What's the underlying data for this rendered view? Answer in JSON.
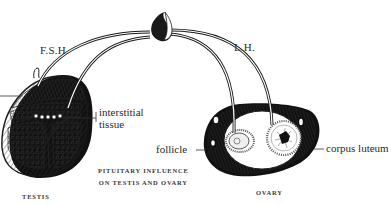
{
  "diagram": {
    "title_lines": [
      "PITUITARY INFLUENCE",
      "ON TESTIS AND OVARY"
    ],
    "hormones": {
      "fsh": "F.S.H.",
      "lh": "L.H."
    },
    "organs": {
      "testis": "TESTIS",
      "ovary": "OVARY"
    },
    "structures": {
      "interstitial_line1": "interstitial",
      "interstitial_line2": "tissue",
      "follicle": "follicle",
      "corpus_luteum": "corpus luteum"
    },
    "nodes": [
      {
        "id": "pituitary",
        "label": "",
        "shape": "teardrop",
        "x": 161,
        "y": 24
      },
      {
        "id": "testis",
        "label": "TESTIS",
        "shape": "ellipse",
        "x": 48,
        "y": 125
      },
      {
        "id": "ovary",
        "label": "OVARY",
        "shape": "ellipse",
        "x": 263,
        "y": 153
      }
    ],
    "edges": [
      {
        "from": "pituitary",
        "to": "testis",
        "label": "F.S.H.",
        "style": "double-line-arc"
      },
      {
        "from": "pituitary",
        "to": "testis-interstitial",
        "label": "",
        "style": "double-line-arc"
      },
      {
        "from": "pituitary",
        "to": "ovary-follicle",
        "label": "",
        "style": "double-line-arc"
      },
      {
        "from": "pituitary",
        "to": "ovary-corpus-luteum",
        "label": "L.H.",
        "style": "double-line-arc"
      }
    ],
    "colors": {
      "ink": "#1a1a1a",
      "paper": "#ffffff"
    }
  }
}
